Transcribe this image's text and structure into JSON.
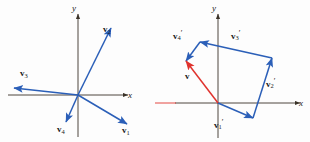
{
  "figure": {
    "background": "#fdfdfd",
    "vector_color": "#2b5fb8",
    "result_color": "#e0332e",
    "axis_color": "#3a3228",
    "label_color": "#1a1a1a"
  },
  "left_panel": {
    "name": "four-vectors-from-origin",
    "axes": {
      "x_label": "x",
      "y_label": "y"
    },
    "origin": {
      "x": 78,
      "y": 95
    },
    "vectors": [
      {
        "id": "v1",
        "label_main": "v",
        "label_sub": "1",
        "label_prime": "",
        "tip": {
          "x": 127,
          "y": 124
        },
        "color": "#2b5fb8"
      },
      {
        "id": "v2",
        "label_main": "v",
        "label_sub": "2",
        "label_prime": "",
        "tip": {
          "x": 111,
          "y": 28
        },
        "color": "#2b5fb8"
      },
      {
        "id": "v3",
        "label_main": "v",
        "label_sub": "3",
        "label_prime": "",
        "tip": {
          "x": 14,
          "y": 88
        },
        "color": "#2b5fb8"
      },
      {
        "id": "v4",
        "label_main": "v",
        "label_sub": "4",
        "label_prime": "",
        "tip": {
          "x": 66,
          "y": 122
        },
        "color": "#2b5fb8"
      }
    ]
  },
  "right_panel": {
    "name": "head-to-tail-vector-sum",
    "axes": {
      "x_label": "x",
      "y_label": "y"
    },
    "origin": {
      "x": 218,
      "y": 103
    },
    "vectors": [
      {
        "id": "v1p",
        "label_main": "v",
        "label_sub": "1",
        "label_prime": "′",
        "from": {
          "x": 218,
          "y": 103
        },
        "to": {
          "x": 253,
          "y": 118
        },
        "color": "#2b5fb8"
      },
      {
        "id": "v2p",
        "label_main": "v",
        "label_sub": "2",
        "label_prime": "′",
        "from": {
          "x": 253,
          "y": 118
        },
        "to": {
          "x": 272,
          "y": 58
        },
        "color": "#2b5fb8"
      },
      {
        "id": "v3p",
        "label_main": "v",
        "label_sub": "3",
        "label_prime": "′",
        "from": {
          "x": 272,
          "y": 58
        },
        "to": {
          "x": 200,
          "y": 42
        },
        "color": "#2b5fb8"
      },
      {
        "id": "v4p",
        "label_main": "v",
        "label_sub": "4",
        "label_prime": "′",
        "from": {
          "x": 200,
          "y": 42
        },
        "to": {
          "x": 186,
          "y": 61
        },
        "color": "#2b5fb8"
      }
    ],
    "resultant": {
      "id": "v",
      "label_main": "v",
      "label_sub": "",
      "label_prime": "",
      "from": {
        "x": 218,
        "y": 103
      },
      "to": {
        "x": 186,
        "y": 61
      },
      "color": "#e0332e"
    }
  }
}
